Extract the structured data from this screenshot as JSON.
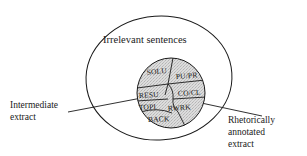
{
  "figure": {
    "name": "rhetorical-extract-venn-diagram",
    "outer_region_label": "Irrelevant sentences",
    "left_callout": {
      "line1": "Intermediate",
      "line2": "extract"
    },
    "right_callout": {
      "line1": "Rhetorically",
      "line2": "annotated",
      "line3": "extract"
    },
    "inner_cells": [
      {
        "id": "solu",
        "label": "SOLU"
      },
      {
        "id": "pupr",
        "label": "PU/PR"
      },
      {
        "id": "resu",
        "label": "RESU"
      },
      {
        "id": "cocl",
        "label": "CO/CL"
      },
      {
        "id": "topi",
        "label": "TOPI"
      },
      {
        "id": "rwrk",
        "label": "RWRK"
      },
      {
        "id": "back",
        "label": "BACK"
      }
    ],
    "colors": {
      "stroke": "#1a1a1a",
      "inner_fill": "#d9d9d9",
      "background": "#ffffff",
      "text": "#1a1a1a"
    }
  }
}
